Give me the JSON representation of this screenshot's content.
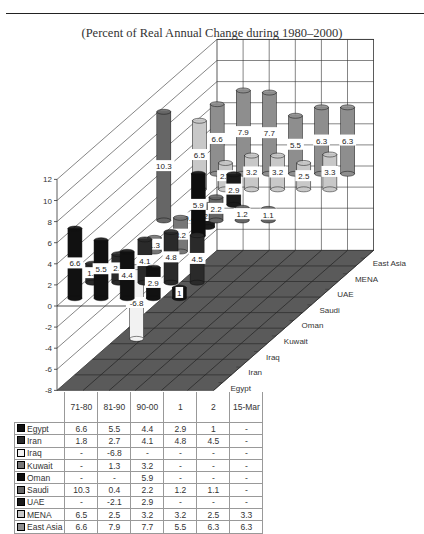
{
  "page": {
    "subtitle": "(Percent of Real Annual Change during 1980–2000)"
  },
  "chart_data": {
    "type": "bar",
    "subtype": "3d-cylinder",
    "title": "(Percent of Real Annual Change during 1980–2000)",
    "categories": [
      "71-80",
      "81-90",
      "90-00",
      "1",
      "2",
      "15-Mar"
    ],
    "xlabel": "",
    "ylabel": "",
    "ylim": [
      -8,
      12
    ],
    "yticks": [
      -8,
      -6,
      -4,
      -2,
      0,
      2,
      4,
      6,
      8,
      10,
      12
    ],
    "grid": true,
    "legend_position": "data-table",
    "depth_axis_labels": [
      "Egypt",
      "Iran",
      "Iraq",
      "Kuwait",
      "Oman",
      "Saudi",
      "UAE",
      "MENA",
      "East Asia"
    ],
    "series": [
      {
        "name": "Egypt",
        "color": "#111111",
        "values": [
          6.6,
          5.5,
          4.4,
          2.9,
          1,
          null
        ],
        "display": [
          "6.6",
          "5.5",
          "4.4",
          "2.9",
          "1",
          "-"
        ]
      },
      {
        "name": "Iran",
        "color": "#2a2a2a",
        "values": [
          1.8,
          2.7,
          4.1,
          4.8,
          4.5,
          null
        ],
        "display": [
          "1.8",
          "2.7",
          "4.1",
          "4.8",
          "4.5",
          "-"
        ]
      },
      {
        "name": "Iraq",
        "color": "#f2f2f2",
        "values": [
          null,
          -6.8,
          null,
          null,
          null,
          null
        ],
        "display": [
          "-",
          "-6.8",
          "-",
          "-",
          "-",
          "-"
        ]
      },
      {
        "name": "Kuwait",
        "color": "#777777",
        "values": [
          null,
          1.3,
          3.2,
          null,
          null,
          null
        ],
        "display": [
          "-",
          "1.3",
          "3.2",
          "-",
          "-",
          "-"
        ]
      },
      {
        "name": "Oman",
        "color": "#0d0d0d",
        "values": [
          null,
          null,
          5.9,
          null,
          null,
          null
        ],
        "display": [
          "-",
          "-",
          "5.9",
          "-",
          "-",
          "-"
        ]
      },
      {
        "name": "Saudi",
        "color": "#666666",
        "values": [
          10.3,
          0.4,
          2.2,
          1.2,
          1.1,
          null
        ],
        "display": [
          "10.3",
          "0.4",
          "2.2",
          "1.2",
          "1.1",
          "-"
        ]
      },
      {
        "name": "UAE",
        "color": "#1a1a1a",
        "values": [
          null,
          -2.1,
          2.9,
          null,
          null,
          null
        ],
        "display": [
          "-",
          "-2.1",
          "2.9",
          "-",
          "-",
          "-"
        ]
      },
      {
        "name": "MENA",
        "color": "#c8c8c8",
        "values": [
          6.5,
          2.5,
          3.2,
          3.2,
          2.5,
          3.3
        ],
        "display": [
          "6.5",
          "2.5",
          "3.2",
          "3.2",
          "2.5",
          "3.3"
        ]
      },
      {
        "name": "East Asia",
        "color": "#8e8e8e",
        "values": [
          6.6,
          7.9,
          7.7,
          5.5,
          6.3,
          6.3
        ],
        "display": [
          "6.6",
          "7.9",
          "7.7",
          "5.5",
          "6.3",
          "6.3"
        ]
      }
    ]
  },
  "table": {
    "headers": [
      "71-80",
      "81-90",
      "90-00",
      "1",
      "2",
      "15-Mar"
    ]
  }
}
